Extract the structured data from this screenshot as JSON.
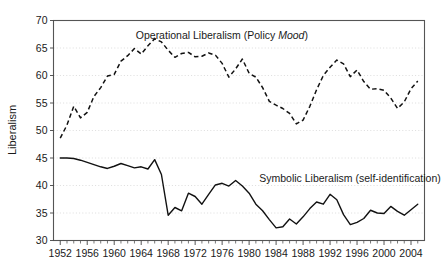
{
  "chart_data": {
    "type": "line",
    "title": "",
    "xlabel": "",
    "ylabel": "Liberalism",
    "xlim": [
      1951,
      2006
    ],
    "ylim": [
      30,
      70
    ],
    "yticks": [
      30,
      35,
      40,
      45,
      50,
      55,
      60,
      65,
      70
    ],
    "xticks": [
      1952,
      1956,
      1960,
      1964,
      1968,
      1972,
      1976,
      1980,
      1984,
      1988,
      1992,
      1996,
      2000,
      2004
    ],
    "xtick_minor_step": 1,
    "grid": "horizontal-dotted",
    "legend": "inline-annotations",
    "series": [
      {
        "name": "Operational Liberalism (Policy Mood)",
        "style": "dashed",
        "label_text_plain": "Operational Liberalism (Policy ",
        "label_text_italic": "Mood",
        "label_text_tail": ")",
        "label_x": 1963.2,
        "label_y": 66.6,
        "x": [
          1952,
          1953,
          1954,
          1955,
          1956,
          1957,
          1958,
          1959,
          1960,
          1961,
          1962,
          1963,
          1964,
          1965,
          1966,
          1967,
          1968,
          1969,
          1970,
          1971,
          1972,
          1973,
          1974,
          1975,
          1976,
          1977,
          1978,
          1979,
          1980,
          1981,
          1982,
          1983,
          1984,
          1985,
          1986,
          1987,
          1988,
          1989,
          1990,
          1991,
          1992,
          1993,
          1994,
          1995,
          1996,
          1997,
          1998,
          1999,
          2000,
          2001,
          2002,
          2003,
          2004,
          2005
        ],
        "values": [
          48.6,
          51.0,
          54.4,
          52.3,
          53.3,
          56.2,
          57.8,
          59.9,
          60.2,
          62.6,
          63.6,
          64.9,
          63.9,
          65.4,
          66.7,
          66.1,
          64.6,
          63.3,
          64.0,
          64.2,
          63.4,
          63.5,
          64.1,
          63.7,
          62.2,
          59.7,
          61.2,
          63.0,
          60.4,
          59.7,
          57.8,
          55.3,
          54.6,
          54.0,
          53.1,
          51.2,
          51.9,
          54.4,
          57.4,
          60.0,
          61.5,
          62.8,
          62.1,
          59.8,
          61.0,
          58.9,
          57.5,
          57.6,
          57.3,
          55.9,
          54.0,
          55.2,
          57.6,
          59.0
        ]
      },
      {
        "name": "Symbolic Liberalism (self-identification)",
        "style": "solid",
        "label_text_plain": "Symbolic Liberalism (self-identification)",
        "label_x": 1981.5,
        "label_y": 40.7,
        "x": [
          1952,
          1953,
          1954,
          1955,
          1956,
          1957,
          1958,
          1959,
          1960,
          1961,
          1962,
          1963,
          1964,
          1965,
          1966,
          1967,
          1968,
          1969,
          1970,
          1971,
          1972,
          1973,
          1974,
          1975,
          1976,
          1977,
          1978,
          1979,
          1980,
          1981,
          1982,
          1983,
          1984,
          1985,
          1986,
          1987,
          1988,
          1989,
          1990,
          1991,
          1992,
          1993,
          1994,
          1995,
          1996,
          1997,
          1998,
          1999,
          2000,
          2001,
          2002,
          2003,
          2004,
          2005
        ],
        "values": [
          45.0,
          45.0,
          44.9,
          44.6,
          44.2,
          43.8,
          43.4,
          43.1,
          43.5,
          44.0,
          43.6,
          43.2,
          43.4,
          43.0,
          44.7,
          42.0,
          34.6,
          36.0,
          35.4,
          38.6,
          38.0,
          36.6,
          38.4,
          40.1,
          40.4,
          39.9,
          40.9,
          39.9,
          38.6,
          36.6,
          35.4,
          33.8,
          32.3,
          32.5,
          33.9,
          33.0,
          34.3,
          35.8,
          37.0,
          36.6,
          38.4,
          37.4,
          34.7,
          32.9,
          33.3,
          34.0,
          35.5,
          35.0,
          34.9,
          36.2,
          35.3,
          34.6,
          35.6,
          36.6
        ]
      }
    ]
  }
}
